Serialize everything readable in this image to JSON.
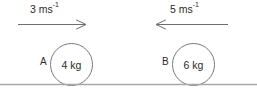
{
  "diagram": {
    "type": "physics-collision-diagram",
    "title": "",
    "ground": {
      "name": "horizontal-surface",
      "color": "#a8a8a8"
    },
    "colors": {
      "text": "#2b2b2b",
      "stroke": "#7a7a7a",
      "arrow": "#6e6e6e",
      "ground": "#a8a8a8",
      "background": "#ffffff"
    },
    "objects": [
      {
        "id": "A",
        "body_label": "A",
        "mass_text": "4 kg",
        "mass_value": 4,
        "mass_unit": "kg",
        "velocity_number": "3",
        "velocity_unit": "ms",
        "velocity_exponent": "-1",
        "velocity_text": "3 ms",
        "velocity_value": 3,
        "direction": "right"
      },
      {
        "id": "B",
        "body_label": "B",
        "mass_text": "6 kg",
        "mass_value": 6,
        "mass_unit": "kg",
        "velocity_number": "5",
        "velocity_unit": "ms",
        "velocity_exponent": "-1",
        "velocity_text": "5 ms",
        "velocity_value": 5,
        "direction": "left"
      }
    ]
  }
}
